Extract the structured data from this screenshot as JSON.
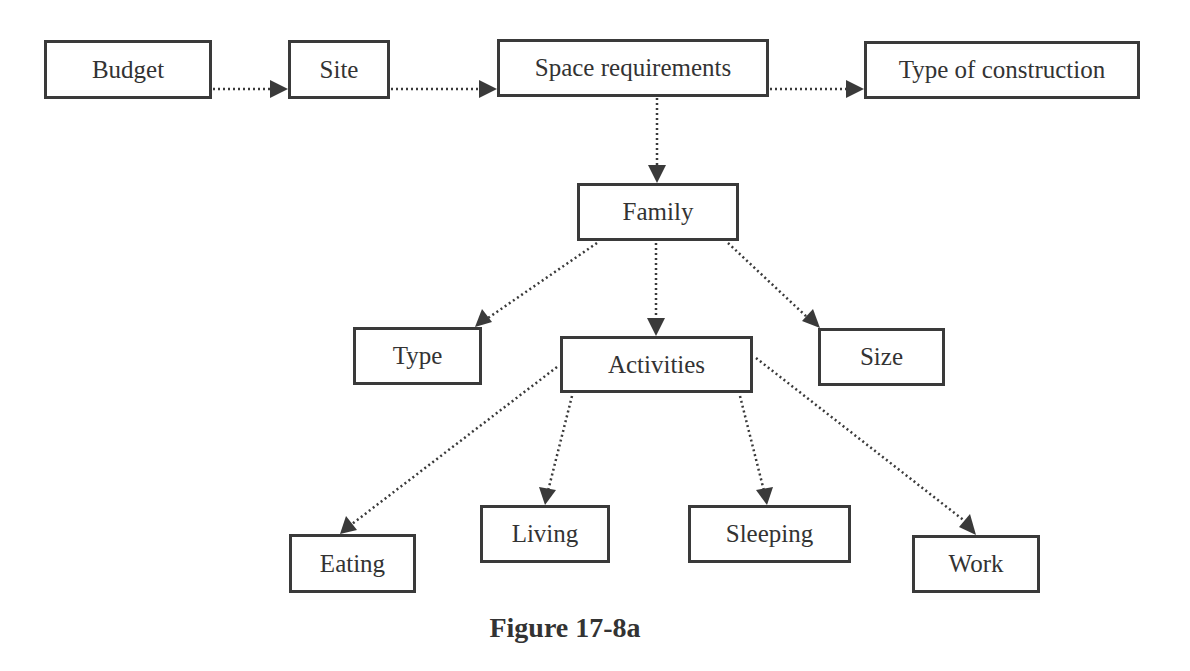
{
  "diagram": {
    "caption": "Figure 17-8a",
    "colors": {
      "line": "#3a3a3a",
      "text": "#333333",
      "background": "#ffffff"
    },
    "nodes": {
      "budget": {
        "label": "Budget",
        "box": [
          44,
          40,
          168,
          59
        ]
      },
      "site": {
        "label": "Site",
        "box": [
          288,
          40,
          102,
          59
        ]
      },
      "space_requirements": {
        "label": "Space requirements",
        "box": [
          497,
          39,
          272,
          58
        ]
      },
      "type_of_construction": {
        "label": "Type of construction",
        "box": [
          864,
          41,
          276,
          58
        ]
      },
      "family": {
        "label": "Family",
        "box": [
          577,
          183,
          162,
          58
        ]
      },
      "type": {
        "label": "Type",
        "box": [
          353,
          327,
          129,
          58
        ]
      },
      "activities": {
        "label": "Activities",
        "box": [
          560,
          336,
          193,
          57
        ]
      },
      "size": {
        "label": "Size",
        "box": [
          818,
          328,
          127,
          58
        ]
      },
      "eating": {
        "label": "Eating",
        "box": [
          289,
          534,
          127,
          59
        ]
      },
      "living": {
        "label": "Living",
        "box": [
          480,
          505,
          130,
          58
        ]
      },
      "sleeping": {
        "label": "Sleeping",
        "box": [
          688,
          505,
          163,
          58
        ]
      },
      "work": {
        "label": "Work",
        "box": [
          912,
          535,
          128,
          58
        ]
      }
    },
    "edges": [
      {
        "from": "budget",
        "to": "site",
        "style": "dotted-arrow"
      },
      {
        "from": "site",
        "to": "space_requirements",
        "style": "dotted-arrow"
      },
      {
        "from": "space_requirements",
        "to": "type_of_construction",
        "style": "dotted-arrow"
      },
      {
        "from": "space_requirements",
        "to": "family",
        "style": "dotted-arrow"
      },
      {
        "from": "family",
        "to": "type",
        "style": "dotted-arrow"
      },
      {
        "from": "family",
        "to": "activities",
        "style": "dotted-arrow"
      },
      {
        "from": "family",
        "to": "size",
        "style": "dotted-arrow"
      },
      {
        "from": "activities",
        "to": "eating",
        "style": "dotted-arrow"
      },
      {
        "from": "activities",
        "to": "living",
        "style": "dotted-arrow"
      },
      {
        "from": "activities",
        "to": "sleeping",
        "style": "dotted-arrow"
      },
      {
        "from": "activities",
        "to": "work",
        "style": "dotted-arrow"
      }
    ]
  }
}
